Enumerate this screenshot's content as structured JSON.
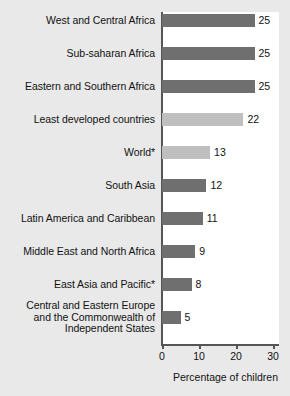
{
  "chart_data": {
    "type": "bar",
    "orientation": "horizontal",
    "title": "",
    "xlabel": "Percentage of children",
    "ylabel": "",
    "xlim": [
      0,
      30
    ],
    "xticks": [
      0,
      10,
      20,
      30
    ],
    "grid": false,
    "legend": null,
    "categories": [
      "West and Central Africa",
      "Sub-saharan Africa",
      "Eastern and Southern Africa",
      "Least developed countries",
      "World*",
      "South Asia",
      "Latin America and Caribbean",
      "Middle East and North Africa",
      "East Asia and Pacific*",
      "Central and Eastern Europe and the Commonwealth of Independent States"
    ],
    "values": [
      25,
      25,
      25,
      22,
      13,
      12,
      11,
      9,
      8,
      5
    ],
    "value_labels": [
      "25",
      "25",
      "25",
      "22",
      "13",
      "12",
      "11",
      "9",
      "8",
      "5"
    ],
    "bar_colors": [
      "#6f6f6f",
      "#6f6f6f",
      "#6f6f6f",
      "#bfbfbf",
      "#bfbfbf",
      "#6f6f6f",
      "#6f6f6f",
      "#6f6f6f",
      "#6f6f6f",
      "#6f6f6f"
    ],
    "category_lines": [
      [
        "West and Central Africa"
      ],
      [
        "Sub-saharan Africa"
      ],
      [
        "Eastern and Southern Africa"
      ],
      [
        "Least developed countries"
      ],
      [
        "World*"
      ],
      [
        "South Asia"
      ],
      [
        "Latin America and Caribbean"
      ],
      [
        "Middle East and North Africa"
      ],
      [
        "East Asia and Pacific*"
      ],
      [
        "Central and Eastern Europe",
        "and the Commonwealth of",
        "Independent States"
      ]
    ]
  },
  "style": {
    "page_background": "#e9e9e9",
    "plot_background": "#ffffff",
    "axis_color": "#555555",
    "text_color": "#121212",
    "bar_dark": "#6f6f6f",
    "bar_light": "#bfbfbf"
  }
}
